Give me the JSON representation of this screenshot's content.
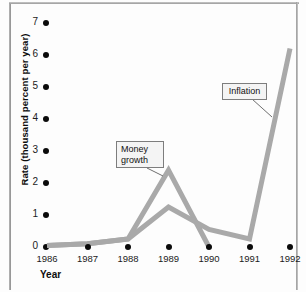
{
  "chart_data": {
    "type": "line",
    "title": "",
    "xlabel": "Year",
    "ylabel": "Rate (thousand percent per year)",
    "categories": [
      "1986",
      "1987",
      "1988",
      "1989",
      "1990",
      "1991",
      "1992"
    ],
    "x": [
      1986,
      1987,
      1988,
      1989,
      1990,
      1991,
      1992
    ],
    "ylim": [
      0,
      7
    ],
    "xlim": [
      1986,
      1992
    ],
    "yticks": [
      0,
      1,
      2,
      3,
      4,
      5,
      6,
      7
    ],
    "ytick_labels": [
      "0",
      "1",
      "2",
      "3",
      "4",
      "5",
      "6",
      "7"
    ],
    "grid": false,
    "legend": "annotations",
    "series": [
      {
        "name": "Money growth",
        "color": "#a9a9a9",
        "x": [
          1986,
          1987,
          1988,
          1989,
          1990
        ],
        "values": [
          0.05,
          0.1,
          0.25,
          2.4,
          0.0
        ]
      },
      {
        "name": "Inflation",
        "color": "#a9a9a9",
        "x": [
          1986,
          1987,
          1988,
          1989,
          1990,
          1991,
          1992
        ],
        "values": [
          0.05,
          0.1,
          0.25,
          1.25,
          0.55,
          0.25,
          6.2
        ]
      }
    ],
    "annotations": [
      {
        "label": "Money\ngrowth",
        "line1": "Money",
        "line2": "growth",
        "points_to": [
          1989,
          2.4
        ]
      },
      {
        "label": "Inflation",
        "line1": "Inflation",
        "line2": "",
        "points_to": [
          1992,
          4.0
        ]
      }
    ],
    "tick_marker_style": "filled-circle",
    "line_color": "#a9a9a9",
    "axis_text_color": "#1b1b1b"
  },
  "axes": {
    "y_title": "Rate (thousand percent per year)",
    "x_title": "Year"
  },
  "callouts": {
    "money_line1": "Money",
    "money_line2": "growth",
    "inflation": "Inflation"
  }
}
